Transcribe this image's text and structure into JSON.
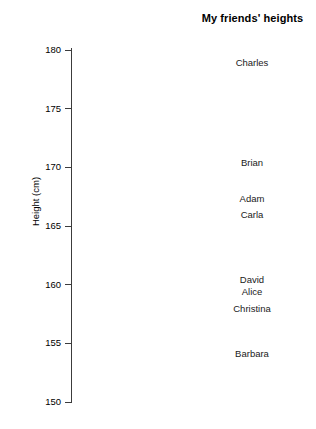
{
  "chart_data": {
    "type": "scatter",
    "title": "My friends' heights",
    "xlabel": "",
    "ylabel": "Height (cm)",
    "ylim": [
      150,
      180
    ],
    "yticks": [
      150,
      155,
      160,
      165,
      170,
      175,
      180
    ],
    "ytick_labels": [
      "150",
      "155",
      "160",
      "165",
      "170",
      "175",
      "180"
    ],
    "grid": false,
    "legend": false,
    "point_style": "text-labels-only",
    "categories": [
      "Charles",
      "Brian",
      "Adam",
      "Carla",
      "David",
      "Alice",
      "Christina",
      "Barbara"
    ],
    "values": [
      178.9,
      170.4,
      167.3,
      165.9,
      160.4,
      159.4,
      157.9,
      154.1
    ],
    "points": [
      {
        "label": "Charles",
        "height_cm": 178.9
      },
      {
        "label": "Brian",
        "height_cm": 170.4
      },
      {
        "label": "Adam",
        "height_cm": 167.3
      },
      {
        "label": "Carla",
        "height_cm": 165.9
      },
      {
        "label": "David",
        "height_cm": 160.4
      },
      {
        "label": "Alice",
        "height_cm": 159.4
      },
      {
        "label": "Christina",
        "height_cm": 157.9
      },
      {
        "label": "Barbara",
        "height_cm": 154.1
      }
    ],
    "colors": {
      "axis": "#3c3c3c",
      "text": "#1a1a1a",
      "title": "#000000",
      "background": "#ffffff"
    }
  }
}
